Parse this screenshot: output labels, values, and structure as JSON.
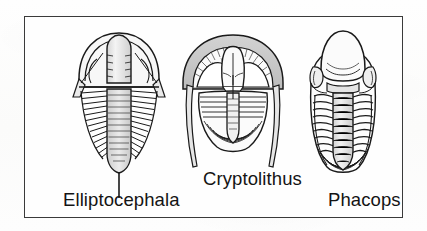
{
  "figure": {
    "caption_items": [
      {
        "id": "elliptocephala",
        "label": "Elliptocephala",
        "icon_name": "trilobite-elliptocephala-illustration"
      },
      {
        "id": "cryptolithus",
        "label": "Cryptolithus",
        "icon_name": "trilobite-cryptolithus-illustration"
      },
      {
        "id": "phacops",
        "label": "Phacops",
        "icon_name": "trilobite-phacops-illustration"
      }
    ],
    "colors": {
      "background": "#fdfdfc",
      "frame_border": "#3a3a3a",
      "ink": "#1a1a1a",
      "shade_light": "#dcdcdc",
      "shade_mid": "#bdbdbd",
      "fill_white": "#ffffff"
    }
  }
}
